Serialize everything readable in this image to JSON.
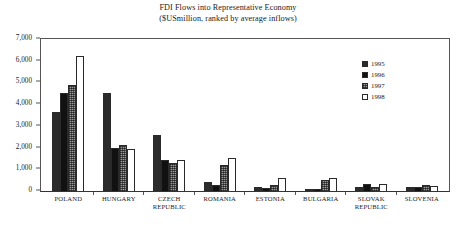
{
  "chart_data": {
    "type": "bar",
    "title": "FDI Flows into Representative Economy",
    "subtitle": "($USmillion, ranked by average inflows)",
    "xlabel": "",
    "ylabel": "",
    "ylim": [
      0,
      7000
    ],
    "ytick_step": 1000,
    "ytick_labels": [
      "7,000",
      "6,000",
      "5,000",
      "4,000",
      "3,000",
      "2,000",
      "1,000",
      "0"
    ],
    "ytick_values": [
      7000,
      6000,
      5000,
      4000,
      3000,
      2000,
      1000,
      0
    ],
    "grid": false,
    "legend_position": "top-right",
    "categories": [
      "POLAND",
      "HUNGARY",
      "CZECH REPUBLIC",
      "ROMANIA",
      "ESTONIA",
      "BULGARIA",
      "SLOVAK REPUBLIC",
      "SLOVENIA"
    ],
    "series": [
      {
        "name": "1995",
        "values": [
          3660,
          4520,
          2560,
          420,
          200,
          100,
          190,
          180
        ]
      },
      {
        "name": "1996",
        "values": [
          4500,
          2000,
          1430,
          265,
          150,
          115,
          330,
          190
        ]
      },
      {
        "name": "1997",
        "values": [
          4900,
          2100,
          1300,
          1215,
          270,
          510,
          180,
          300
        ]
      },
      {
        "name": "1998",
        "values": [
          6200,
          1950,
          1450,
          1500,
          610,
          620,
          320,
          220
        ]
      }
    ]
  },
  "legend": {
    "items": [
      {
        "label": "1995",
        "color": "#2b2b2b"
      },
      {
        "label": "1996",
        "color": "#111111"
      },
      {
        "label": "1997",
        "color": "#9a9a9a"
      },
      {
        "label": "1998",
        "color": "#ffffff"
      }
    ]
  },
  "axis": {
    "y_max_label": "7,000",
    "y_min_label": "0"
  }
}
